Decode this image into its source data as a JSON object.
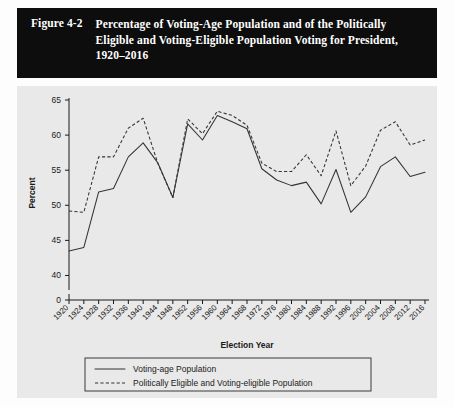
{
  "figure": {
    "number": "Figure 4-2",
    "title": "Percentage of Voting-Age Population and of the Politically Eligible and Voting-Eligible Population Voting for President, 1920–2016"
  },
  "chart_data": {
    "type": "line",
    "title": "",
    "xlabel": "Election Year",
    "ylabel": "Percent",
    "categories": [
      1920,
      1924,
      1928,
      1932,
      1936,
      1940,
      1944,
      1948,
      1952,
      1956,
      1960,
      1964,
      1968,
      1972,
      1976,
      1980,
      1984,
      1988,
      1992,
      1996,
      2000,
      2004,
      2008,
      2012,
      2016
    ],
    "xtick_labels": [
      "1920",
      "1924",
      "1928",
      "1932",
      "1936",
      "1940",
      "1944",
      "1948",
      "1952",
      "1956",
      "1960",
      "1964",
      "1968",
      "1972",
      "1976",
      "1980",
      "1984",
      "1988",
      "1992",
      "1996",
      "2000",
      "2004",
      "2008",
      "2012",
      "2016"
    ],
    "ytick_labels": [
      "0",
      "40",
      "45",
      "50",
      "55",
      "60",
      "65"
    ],
    "ytick_values": [
      0,
      40,
      45,
      50,
      55,
      60,
      65
    ],
    "ylim": [
      38.5,
      65
    ],
    "axis_break": true,
    "grid": false,
    "legend_position": "below",
    "series": [
      {
        "name": "Voting-age Population",
        "style": "solid",
        "values": [
          43.5,
          44.0,
          51.9,
          52.4,
          56.9,
          58.9,
          56.0,
          51.1,
          61.6,
          59.3,
          62.8,
          61.9,
          60.9,
          55.2,
          53.6,
          52.8,
          53.3,
          50.2,
          55.1,
          49.0,
          51.2,
          55.5,
          56.9,
          54.1,
          54.7
        ]
      },
      {
        "name": "Politically Eligible and Voting-eligible Population",
        "style": "dashed",
        "values": [
          49.2,
          49.0,
          56.9,
          56.9,
          61.0,
          62.4,
          55.9,
          51.1,
          62.3,
          60.2,
          63.4,
          62.8,
          61.4,
          56.0,
          54.8,
          54.8,
          57.2,
          54.2,
          60.6,
          52.8,
          55.6,
          60.7,
          61.9,
          58.6,
          59.3
        ]
      }
    ]
  },
  "legend": {
    "items": [
      {
        "label": "Voting-age Population",
        "style": "solid"
      },
      {
        "label": "Politically Eligible and Voting-eligible Population",
        "style": "dashed"
      }
    ]
  }
}
